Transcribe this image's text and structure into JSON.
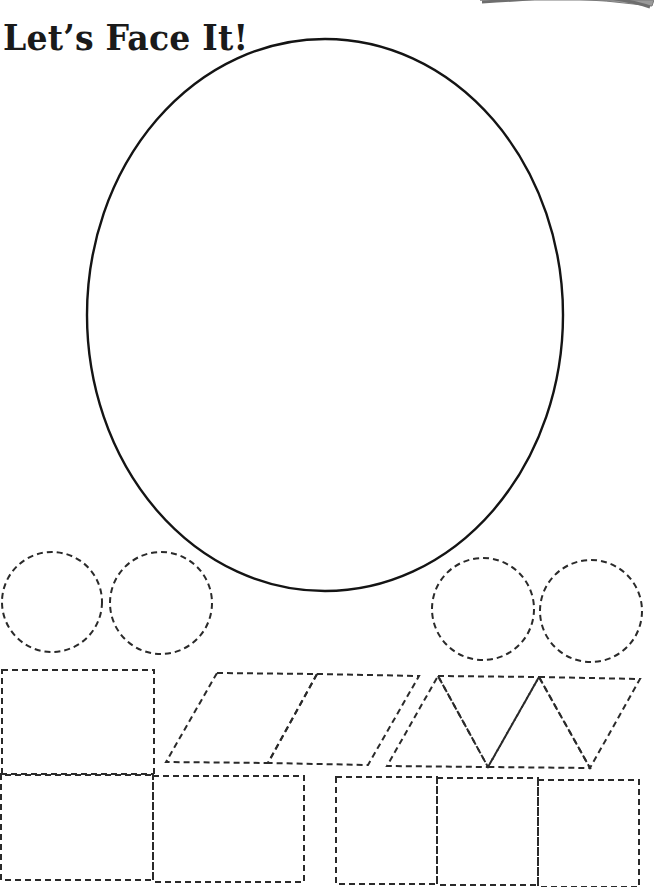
{
  "worksheet": {
    "title": "Let’s Face It!",
    "face_outline": {
      "shape": "oval",
      "line_style": "solid",
      "color": "#141414"
    },
    "cutout_line_color": "#2a2a2a",
    "corner_tab_color": "#8a8a8a",
    "cutout_shapes": [
      {
        "name": "circle",
        "count": 4,
        "line_style": "dashed"
      },
      {
        "name": "rectangle",
        "count": 3,
        "line_style": "dashed"
      },
      {
        "name": "parallelogram",
        "count": 2,
        "line_style": "dashed"
      },
      {
        "name": "triangle",
        "count": 4,
        "line_style": "dashed"
      },
      {
        "name": "square",
        "count": 3,
        "line_style": "dashed"
      }
    ]
  }
}
